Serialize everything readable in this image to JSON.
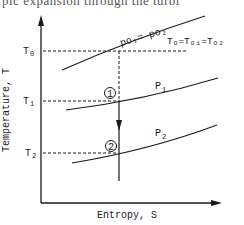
{
  "top_text": "pic expansion through the turbi",
  "diagram": {
    "y_axis_label": "Temperature, T",
    "x_axis_label": "Entropy, S",
    "tick_labels": {
      "t0": "T",
      "t0_sub": "0",
      "t1": "T",
      "t1_sub": "1",
      "t2": "T",
      "t2_sub": "2"
    },
    "curves": {
      "stagnation_label": "po₁= po₂",
      "stagnation_temp_label": "Tₒ=Tₒ₁=Tₒ₂",
      "p1_label": "P",
      "p1_sub": "1",
      "p2_label": "P",
      "p2_sub": "2"
    },
    "states": {
      "state1": "1",
      "state2": "2"
    },
    "colors": {
      "ink": "#1a1a1a",
      "background": "#ffffff"
    }
  }
}
